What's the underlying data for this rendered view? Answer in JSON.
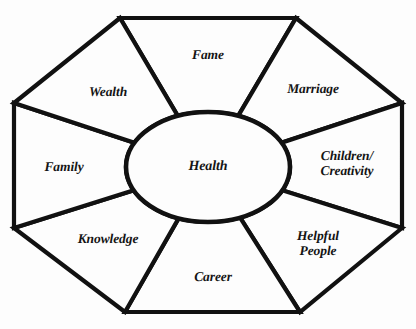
{
  "diagram": {
    "name": "bagua-map",
    "background_color": "#fdfdfd",
    "line_color": "#111111",
    "text_color": "#141414",
    "center": {
      "label": "Health",
      "cx": 208,
      "cy": 167,
      "rx": 82,
      "ry": 55
    },
    "octagon": {
      "vertices": [
        {
          "name": "top-left",
          "x": 120,
          "y": 18
        },
        {
          "name": "top-right",
          "x": 296,
          "y": 18
        },
        {
          "name": "right-top",
          "x": 402,
          "y": 103
        },
        {
          "name": "right-bottom",
          "x": 402,
          "y": 228
        },
        {
          "name": "bottom-right",
          "x": 300,
          "y": 312
        },
        {
          "name": "bottom-left",
          "x": 125,
          "y": 312
        },
        {
          "name": "left-bottom",
          "x": 14,
          "y": 228
        },
        {
          "name": "left-top",
          "x": 14,
          "y": 103
        }
      ]
    },
    "sectors": [
      {
        "id": "fame",
        "label": "Fame",
        "lines": [
          "Fame"
        ],
        "position": "top",
        "label_x": 208,
        "label_y": 55,
        "edge": [
          [
            120,
            18
          ],
          [
            296,
            18
          ]
        ]
      },
      {
        "id": "marriage",
        "label": "Marriage",
        "lines": [
          "Marriage"
        ],
        "position": "top-right",
        "label_x": 313,
        "label_y": 89,
        "edge": [
          [
            296,
            18
          ],
          [
            402,
            103
          ]
        ]
      },
      {
        "id": "children-creativity",
        "label": "Children/ Creativity",
        "lines": [
          "Children/",
          "Creativity"
        ],
        "position": "right",
        "label_x": 347,
        "label_y": 163,
        "edge": [
          [
            402,
            103
          ],
          [
            402,
            228
          ]
        ]
      },
      {
        "id": "helpful-people",
        "label": "Helpful People",
        "lines": [
          "Helpful",
          "People"
        ],
        "position": "bottom-right",
        "label_x": 318,
        "label_y": 243,
        "edge": [
          [
            402,
            228
          ],
          [
            300,
            312
          ]
        ]
      },
      {
        "id": "career",
        "label": "Career",
        "lines": [
          "Career"
        ],
        "position": "bottom",
        "label_x": 213,
        "label_y": 277,
        "edge": [
          [
            300,
            312
          ],
          [
            125,
            312
          ]
        ]
      },
      {
        "id": "knowledge",
        "label": "Knowledge",
        "lines": [
          "Knowledge"
        ],
        "position": "bottom-left",
        "label_x": 108,
        "label_y": 239,
        "edge": [
          [
            125,
            312
          ],
          [
            14,
            228
          ]
        ]
      },
      {
        "id": "family",
        "label": "Family",
        "lines": [
          "Family"
        ],
        "position": "left",
        "label_x": 64,
        "label_y": 167,
        "edge": [
          [
            14,
            228
          ],
          [
            14,
            103
          ]
        ]
      },
      {
        "id": "wealth",
        "label": "Wealth",
        "lines": [
          "Wealth"
        ],
        "position": "top-left",
        "label_x": 108,
        "label_y": 92,
        "edge": [
          [
            14,
            103
          ],
          [
            120,
            18
          ]
        ]
      }
    ]
  }
}
